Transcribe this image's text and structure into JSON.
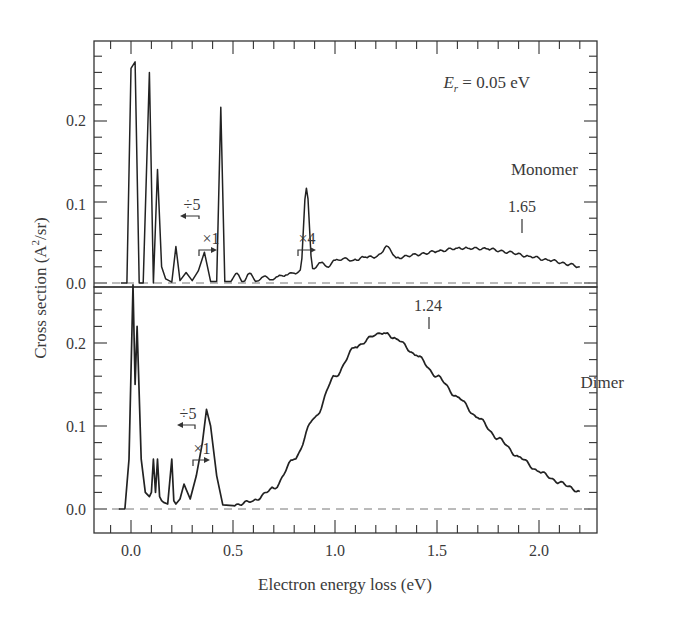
{
  "chart_data": {
    "type": "line",
    "title": "",
    "xlabel": "Electron energy loss (eV)",
    "ylabel": "Cross section (A²/sr)",
    "xlim": [
      -0.18,
      2.28
    ],
    "x_ticks": [
      "0.0",
      "0.5",
      "1.0",
      "1.5",
      "2.0"
    ],
    "grid": false,
    "panels": [
      {
        "name": "Monomer",
        "label": "Monomer",
        "annotation_top": "E_r = 0.05 eV",
        "ylim": [
          -0.02,
          0.28
        ],
        "y_ticks": [
          "0.0",
          "0.1",
          "0.2"
        ],
        "peak_marker": {
          "x": 1.65,
          "label": "1.65"
        },
        "scale_annotations": [
          {
            "text": "÷5",
            "x": 0.2,
            "direction": "left"
          },
          {
            "text": "×1",
            "x": 0.3,
            "direction": "right"
          },
          {
            "text": "×4",
            "x": 0.73,
            "direction": "right"
          }
        ],
        "series": [
          {
            "name": "Monomer spectrum",
            "x": [
              -0.05,
              -0.02,
              0.0,
              0.02,
              0.04,
              0.06,
              0.09,
              0.11,
              0.13,
              0.15,
              0.17,
              0.2,
              0.22,
              0.24,
              0.27,
              0.3,
              0.33,
              0.36,
              0.39,
              0.42,
              0.44,
              0.46,
              0.49,
              0.52,
              0.55,
              0.58,
              0.61,
              0.65,
              0.68,
              0.72,
              0.76,
              0.8,
              0.83,
              0.86,
              0.89,
              0.93,
              0.96,
              1.0,
              1.04,
              1.09,
              1.15,
              1.2,
              1.26,
              1.3,
              1.4,
              1.5,
              1.6,
              1.65,
              1.75,
              1.85,
              1.95,
              2.05,
              2.15,
              2.2
            ],
            "y": [
              0.0,
              0.0,
              0.265,
              0.273,
              0.0,
              0.0,
              0.26,
              0.0,
              0.14,
              0.02,
              0.005,
              0.001,
              0.045,
              0.003,
              0.013,
              0.003,
              0.015,
              0.038,
              0.002,
              0.002,
              0.217,
              0.002,
              0.002,
              0.012,
              0.002,
              0.012,
              0.002,
              0.008,
              0.004,
              0.008,
              0.01,
              0.012,
              0.016,
              0.117,
              0.018,
              0.025,
              0.02,
              0.028,
              0.03,
              0.028,
              0.032,
              0.032,
              0.045,
              0.031,
              0.035,
              0.039,
              0.043,
              0.043,
              0.042,
              0.038,
              0.033,
              0.028,
              0.023,
              0.02
            ]
          }
        ]
      },
      {
        "name": "Dimer",
        "label": "Dimer",
        "ylim": [
          -0.02,
          0.28
        ],
        "y_ticks": [
          "0.0",
          "0.1",
          "0.2"
        ],
        "peak_marker": {
          "x": 1.24,
          "label": "1.24"
        },
        "scale_annotations": [
          {
            "text": "÷5",
            "x": 0.2,
            "direction": "left"
          },
          {
            "text": "×1",
            "x": 0.26,
            "direction": "right"
          }
        ],
        "series": [
          {
            "name": "Dimer spectrum",
            "x": [
              -0.06,
              -0.03,
              -0.01,
              0.01,
              0.02,
              0.03,
              0.05,
              0.07,
              0.09,
              0.1,
              0.11,
              0.12,
              0.13,
              0.14,
              0.15,
              0.16,
              0.18,
              0.2,
              0.21,
              0.22,
              0.24,
              0.26,
              0.29,
              0.32,
              0.35,
              0.37,
              0.39,
              0.42,
              0.45,
              0.5,
              0.6,
              0.7,
              0.8,
              0.9,
              1.0,
              1.1,
              1.2,
              1.24,
              1.3,
              1.4,
              1.5,
              1.6,
              1.7,
              1.8,
              1.9,
              2.0,
              2.1,
              2.2
            ],
            "y": [
              0.0,
              0.0,
              0.06,
              0.27,
              0.15,
              0.22,
              0.06,
              0.02,
              0.015,
              0.02,
              0.06,
              0.02,
              0.06,
              0.015,
              0.01,
              0.008,
              0.006,
              0.06,
              0.01,
              0.006,
              0.012,
              0.03,
              0.012,
              0.04,
              0.08,
              0.12,
              0.1,
              0.04,
              0.005,
              0.004,
              0.01,
              0.025,
              0.06,
              0.11,
              0.16,
              0.195,
              0.21,
              0.212,
              0.205,
              0.185,
              0.16,
              0.135,
              0.11,
              0.085,
              0.063,
              0.045,
              0.032,
              0.021
            ]
          }
        ]
      }
    ]
  },
  "panels": {
    "top": {
      "condition_prefix": "E",
      "condition_sub": "r",
      "condition_value": " = 0.05 eV",
      "label": "Monomer",
      "peak_label": "1.65",
      "scale_div5": "÷5",
      "scale_x1": "×1",
      "scale_x4": "×4"
    },
    "bottom": {
      "label": "Dimer",
      "peak_label": "1.24",
      "scale_div5": "÷5",
      "scale_x1": "×1"
    }
  },
  "axes": {
    "xlabel": "Electron energy loss (eV)",
    "ylabel_main": "Cross section (A",
    "ylabel_sup": "2",
    "ylabel_tail": "/sr)",
    "x_ticks": [
      "0.0",
      "0.5",
      "1.0",
      "1.5",
      "2.0"
    ],
    "y_ticks": [
      "0.0",
      "0.1",
      "0.2"
    ]
  }
}
